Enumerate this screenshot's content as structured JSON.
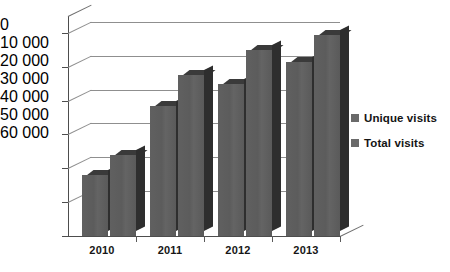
{
  "chart_data": {
    "type": "bar",
    "title": "",
    "subtitle": "",
    "xlabel": "",
    "ylabel": "",
    "categories": [
      "2010",
      "2011",
      "2012",
      "2013"
    ],
    "series": [
      {
        "name": "Unique visits",
        "values": [
          18000,
          38500,
          45000,
          51500
        ],
        "color": "#5f5f5f"
      },
      {
        "name": "Total visits",
        "values": [
          24000,
          47500,
          55000,
          59500
        ],
        "color": "#5f5f5f"
      }
    ],
    "ylim": [
      0,
      65000
    ],
    "yticks": [
      0,
      10000,
      20000,
      30000,
      40000,
      50000,
      60000
    ],
    "ytick_labels": [
      "0",
      "10 000",
      "20 000",
      "30 000",
      "40 000",
      "50 000",
      "60 000"
    ],
    "grid": true,
    "grid_axis": "y",
    "legend_position": "right",
    "style_3d": true,
    "background": "#ffffff",
    "axis_color": "#4d4d4d",
    "grid_color": "#8f8f8f",
    "text_color": "#161616"
  }
}
